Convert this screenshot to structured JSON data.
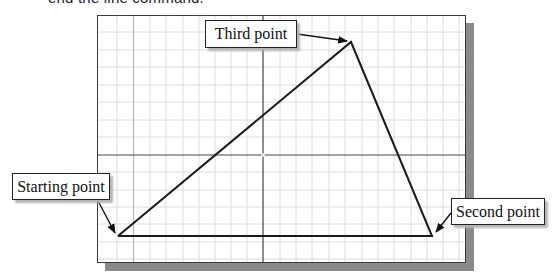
{
  "caption": {
    "text": "end the line command."
  },
  "diagram": {
    "grid": {
      "minor_spacing_x": 16.3,
      "minor_spacing_y": 17.5,
      "grid_color": "#d9d9d9",
      "axis_color": "#3a3a3a"
    },
    "points": {
      "starting": {
        "label": "Starting point",
        "x": 118,
        "y": 236
      },
      "second": {
        "label": "Second point",
        "x": 432,
        "y": 236
      },
      "third": {
        "label": "Third point",
        "x": 351,
        "y": 42
      }
    },
    "labels": [
      {
        "id": "third",
        "text": "Third point"
      },
      {
        "id": "starting",
        "text": "Starting point"
      },
      {
        "id": "second",
        "text": "Second point"
      }
    ]
  }
}
